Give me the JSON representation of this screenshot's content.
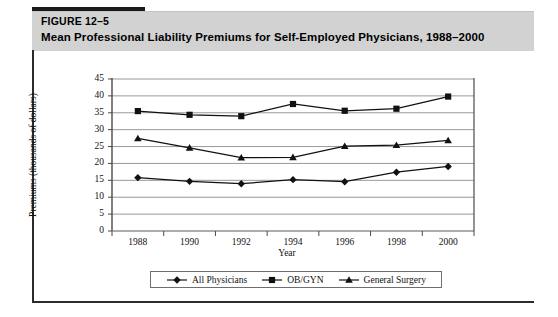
{
  "figure": {
    "number_label": "FIGURE 12–5",
    "title": "Mean Professional Liability Premiums for Self-Employed Physicians, 1988–2000"
  },
  "chart_data": {
    "type": "line",
    "title": "",
    "xlabel": "Year",
    "ylabel": "Premiums (thousands of dollars)",
    "x": [
      1988,
      1990,
      1992,
      1994,
      1996,
      1998,
      2000
    ],
    "categories": [
      "1988",
      "1990",
      "1992",
      "1994",
      "1996",
      "1998",
      "2000"
    ],
    "xlim": [
      1987,
      2001
    ],
    "ylim": [
      0,
      45
    ],
    "yticks": [
      0,
      5,
      10,
      15,
      20,
      25,
      30,
      35,
      40,
      45
    ],
    "ytick_labels": [
      "0",
      "5",
      "10",
      "15",
      "20",
      "25",
      "30",
      "35",
      "40",
      "45"
    ],
    "grid": "horizontal",
    "legend_position": "bottom",
    "series": [
      {
        "name": "All Physicians",
        "marker": "diamond",
        "color": "#111111",
        "values": [
          15.8,
          14.7,
          14.0,
          15.2,
          14.6,
          17.4,
          19.1
        ]
      },
      {
        "name": "OB/GYN",
        "marker": "square",
        "color": "#111111",
        "values": [
          35.5,
          34.4,
          34.0,
          37.6,
          35.6,
          36.2,
          39.8
        ]
      },
      {
        "name": "General Surgery",
        "marker": "triangle",
        "color": "#111111",
        "values": [
          27.4,
          24.6,
          21.7,
          21.8,
          25.1,
          25.4,
          26.8
        ]
      }
    ]
  },
  "legend": {
    "items": [
      {
        "label": "All Physicians",
        "marker": "diamond"
      },
      {
        "label": "OB/GYN",
        "marker": "square"
      },
      {
        "label": "General Surgery",
        "marker": "triangle"
      }
    ]
  }
}
